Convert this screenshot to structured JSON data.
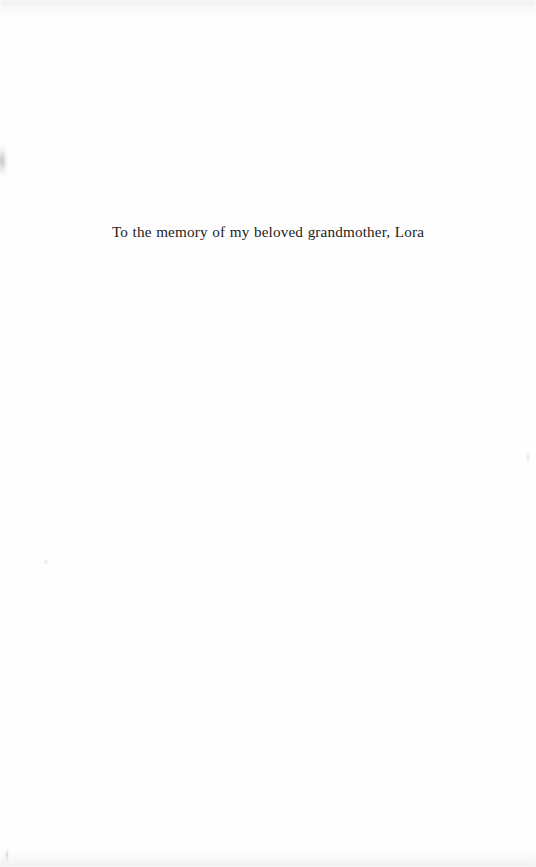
{
  "document": {
    "type": "scanned-book-page",
    "page_kind": "dedication",
    "background_color": "#ffffff",
    "text_color": "#1c1c1c"
  },
  "dedication": {
    "text": "To the memory of my beloved grandmother, Lora"
  },
  "artifacts": {
    "left_edge_smudge": "scan-smudge",
    "left_speck": "scan-speck",
    "right_edge_mark": "scan-mark",
    "top_edge_noise": "scan-noise",
    "bottom_edge_noise": "scan-noise",
    "bottom_left_mark": "scan-mark"
  }
}
